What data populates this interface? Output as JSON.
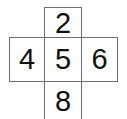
{
  "figure": {
    "name": "plus-shaped-number-grid",
    "background_color": "#ffffff",
    "border_color": "#6e6e6e",
    "text_color": "#111111"
  },
  "cells": {
    "top": {
      "value": "2",
      "position": "top"
    },
    "left": {
      "value": "4",
      "position": "left"
    },
    "center": {
      "value": "5",
      "position": "center"
    },
    "right": {
      "value": "6",
      "position": "right"
    },
    "bottom": {
      "value": "8",
      "position": "bottom"
    }
  },
  "chart_data": {
    "type": "table",
    "title": "",
    "layout": "plus-cross",
    "rows": [
      [
        "",
        "2",
        ""
      ],
      [
        "4",
        "5",
        "6"
      ],
      [
        "",
        "8",
        ""
      ]
    ],
    "values": [
      2,
      4,
      5,
      6,
      8
    ]
  }
}
